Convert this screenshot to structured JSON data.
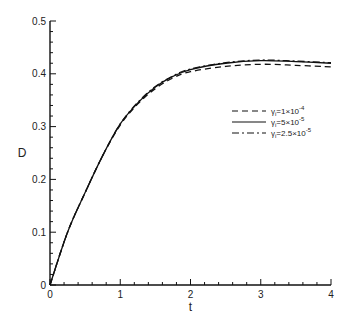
{
  "chart_data": {
    "type": "line",
    "title": "",
    "xlabel": "t",
    "ylabel": "D",
    "xlim": [
      0,
      4
    ],
    "ylim": [
      0,
      0.5
    ],
    "xticks": [
      "0",
      "1",
      "2",
      "3",
      "4"
    ],
    "yticks": [
      "0",
      "0.1",
      "0.2",
      "0.3",
      "0.4",
      "0.5"
    ],
    "grid": false,
    "legend_position": "right, middle-upper inside plot",
    "x": [
      0,
      0.25,
      0.5,
      0.75,
      1.0,
      1.25,
      1.5,
      1.75,
      2.0,
      2.5,
      3.0,
      3.5,
      4.0
    ],
    "series": [
      {
        "name": "γi=1×10⁻⁴",
        "style": "dashed",
        "values": [
          0,
          0.1,
          0.175,
          0.245,
          0.303,
          0.343,
          0.372,
          0.392,
          0.404,
          0.414,
          0.418,
          0.416,
          0.413
        ]
      },
      {
        "name": "γi=5×10⁻⁵",
        "style": "solid",
        "values": [
          0,
          0.1,
          0.175,
          0.245,
          0.305,
          0.345,
          0.375,
          0.395,
          0.408,
          0.42,
          0.425,
          0.423,
          0.42
        ]
      },
      {
        "name": "γi=2.5×10⁻⁵",
        "style": "dashdot",
        "values": [
          0,
          0.1,
          0.175,
          0.245,
          0.305,
          0.346,
          0.376,
          0.396,
          0.409,
          0.421,
          0.426,
          0.424,
          0.421
        ]
      }
    ]
  },
  "labels": {
    "xlabel": "t",
    "ylabel": "D",
    "legend": [
      "γ",
      "γ",
      "γ"
    ],
    "legend_text": [
      "i=1×10",
      "i=5×10",
      "i=2.5×10"
    ],
    "legend_exp": [
      "-4",
      "-5",
      "-5"
    ]
  }
}
